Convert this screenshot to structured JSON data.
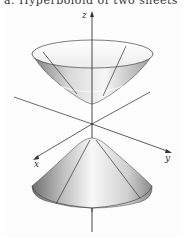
{
  "caption": {
    "text": "a. Hyperboloid of two sheets",
    "partially_visible": true
  },
  "figure": {
    "title": "Hyperboloid of two sheets",
    "axes": {
      "x": "x",
      "y": "y",
      "z": "z"
    },
    "colors": {
      "surface_dark": "#8a8a8a",
      "surface_light": "#f4f4f4",
      "line": "#333333",
      "background": "#ffffff"
    }
  }
}
